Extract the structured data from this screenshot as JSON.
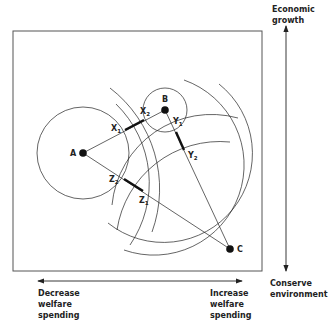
{
  "diagram": {
    "type": "spatial-voting-model",
    "axes": {
      "vertical": {
        "top_label": "Economic\ngrowth",
        "bottom_label": "Conserve\nenvironment"
      },
      "horizontal": {
        "left_label": "Decrease\nwelfare\nspending",
        "right_label": "Increase\nwelfare\nspending"
      }
    },
    "ideal_points": [
      {
        "id": "A",
        "label": "A",
        "x": 83,
        "y": 153
      },
      {
        "id": "B",
        "label": "B",
        "x": 165,
        "y": 110
      },
      {
        "id": "C",
        "label": "C",
        "x": 230,
        "y": 249
      }
    ],
    "intersection_points": [
      {
        "id": "X1",
        "base": "X",
        "sub": "1",
        "x": 125,
        "y": 130
      },
      {
        "id": "X2",
        "base": "X",
        "sub": "2",
        "x": 144,
        "y": 120
      },
      {
        "id": "Y1",
        "base": "Y",
        "sub": "1",
        "x": 176,
        "y": 132
      },
      {
        "id": "Y2",
        "base": "Y",
        "sub": "2",
        "x": 184,
        "y": 150
      },
      {
        "id": "Z1",
        "base": "Z",
        "sub": "1",
        "x": 143,
        "y": 191
      },
      {
        "id": "Z2",
        "base": "Z",
        "sub": "2",
        "x": 124,
        "y": 179
      }
    ],
    "contract_curves": [
      {
        "id": "AB",
        "from": "A",
        "to": "B",
        "bold_segment": [
          "X1",
          "X2"
        ]
      },
      {
        "id": "BC",
        "from": "B",
        "to": "C",
        "bold_segment": [
          "Y1",
          "Y2"
        ]
      },
      {
        "id": "AC",
        "from": "A",
        "to": "C",
        "bold_segment": [
          "Z1",
          "Z2"
        ]
      }
    ],
    "colors": {
      "ink": "#222222",
      "background": "#ffffff",
      "frame": "#555555"
    }
  }
}
